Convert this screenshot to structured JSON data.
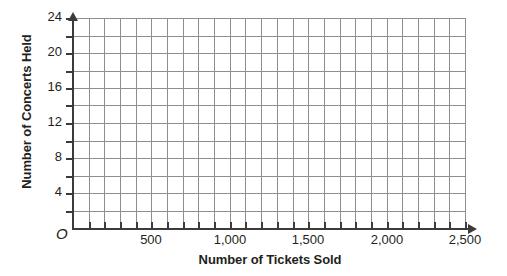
{
  "chart_data": {
    "type": "scatter",
    "title": "",
    "subtitle": "",
    "xlabel": "Number of Tickets Sold",
    "ylabel": "Number of Concerts Held",
    "xlim": [
      0,
      2500
    ],
    "ylim": [
      0,
      24
    ],
    "x_major_step": 500,
    "y_major_step": 4,
    "x_grid_step": 100,
    "y_grid_step": 2,
    "x_tick_labels": [
      "500",
      "1,000",
      "1,500",
      "2,000",
      "2,500"
    ],
    "x_tick_values": [
      500,
      1000,
      1500,
      2000,
      2500
    ],
    "y_tick_labels": [
      "4",
      "8",
      "12",
      "16",
      "20",
      "24"
    ],
    "y_tick_values": [
      4,
      8,
      12,
      16,
      20,
      24
    ],
    "origin_label": "O",
    "grid": true,
    "legend": null,
    "series": [],
    "values": [],
    "annotations": [],
    "note": "Empty coordinate grid; no data plotted."
  },
  "axes": {
    "y_title": "Number of Concerts Held",
    "x_title": "Number of Tickets Sold",
    "origin": "O"
  },
  "colors": {
    "grid": "#8e8e8e",
    "axis": "#3b3b3b",
    "text": "#231f20",
    "background": "#ffffff"
  }
}
